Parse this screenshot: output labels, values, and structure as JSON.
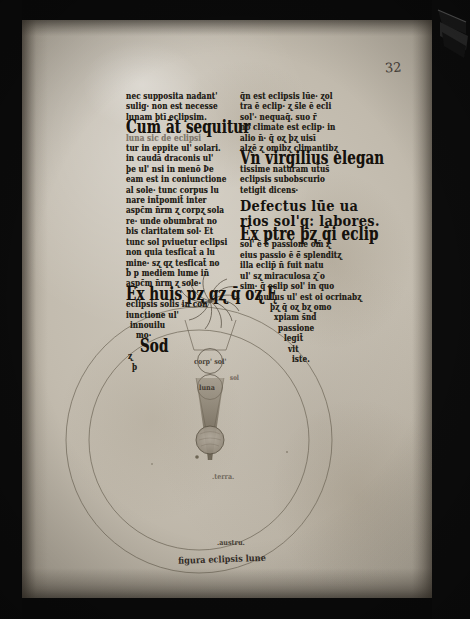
{
  "folio": {
    "number": "32"
  },
  "columns": {
    "left": {
      "lines": [
        {
          "t": "nec supposita nadant'",
          "s": "n"
        },
        {
          "t": "sulig· non est necesse",
          "s": "n"
        },
        {
          "t": "lunam þtī eclipsim.",
          "s": "n"
        },
        {
          "t": "Cum āt sequitur",
          "s": "i"
        },
        {
          "t": "luna sic de eclipsi",
          "s": "f"
        },
        {
          "t": "tur in eppite ul' solari.",
          "s": "n"
        },
        {
          "t": "in caudā draconis ul'",
          "s": "n"
        },
        {
          "t": "þe ul' nsi in menō Þe",
          "s": "n"
        },
        {
          "t": "eam est in coniunctione",
          "s": "n"
        },
        {
          "t": "al sole· tunc corpus lu",
          "s": "n"
        },
        {
          "t": "nare int̄pomit̄ inter",
          "s": "n"
        },
        {
          "t": "aspc̄m n̄rm ʐ corpʐ sola",
          "s": "n"
        },
        {
          "t": "re· unde obumbrat no",
          "s": "n"
        },
        {
          "t": "bis claritatem sol· Et",
          "s": "n"
        },
        {
          "t": "tunc sol pviuetur eclipsi",
          "s": "n"
        },
        {
          "t": "non quia tesficat̄ a lu",
          "s": "n"
        },
        {
          "t": "mine· sʐ qʐ tesficat̄ no",
          "s": "n"
        },
        {
          "t": "b̄ p mediem lume in̄",
          "s": "n"
        },
        {
          "t": "aspc̄m n̄rm ʐ sole·",
          "s": "n"
        },
        {
          "t": "Ex huis pʐ qʐ q̄ oʐ Ę",
          "s": "i"
        },
        {
          "t": "eclipsis solis in con",
          "s": "n"
        },
        {
          "t": "iunctione ul'",
          "s": "n"
        },
        {
          "t": "innouilu",
          "s": "n"
        },
        {
          "t": "mo·",
          "s": "n"
        },
        {
          "t": "Sod",
          "s": "i"
        },
        {
          "t": "ʐ",
          "s": "n"
        },
        {
          "t": "þ",
          "s": "n"
        }
      ],
      "marginal": "sol"
    },
    "right": {
      "lines": [
        {
          "t": "q̄n est eclipsis lūe· ʐol",
          "s": "n"
        },
        {
          "t": "tra ē eclip· ʐ s̄le ē ecli",
          "s": "n"
        },
        {
          "t": "sol'· nequaq̄. suo r̄",
          "s": "n"
        },
        {
          "t": "no climate est eclip· in",
          "s": "n"
        },
        {
          "t": "alio n̄· q̄ oʐ þʐ uisī",
          "s": "n"
        },
        {
          "t": "alʐē ʐ omibʐ climantibʐ",
          "s": "n"
        },
        {
          "t": "Vn virgilius elegan",
          "s": "i"
        },
        {
          "t": "tissime naturam ut̄us̄",
          "s": "n"
        },
        {
          "t": "eclipsis subobscurio",
          "s": "n"
        },
        {
          "t": "tetigit dicens·",
          "s": "n"
        }
      ],
      "heading": [
        "Defectus lūe ua",
        "rios sol'q: labores."
      ],
      "lines2": [
        {
          "t": "Ex ptre þʐ q̄i eclip",
          "s": "i"
        },
        {
          "t": "sol' ē ē̄ passione om̄ ʐ",
          "s": "n"
        },
        {
          "t": "eius passio ē ē̄ splenditʐ",
          "s": "n"
        },
        {
          "t": "illa eclip̄ n̄ fuit natu",
          "s": "n"
        },
        {
          "t": "ul' sʐ miraculosa ʐ ̄o",
          "s": "n"
        },
        {
          "t": "sim· q̄ eclip sol' in quo",
          "s": "n"
        },
        {
          "t": "nullus ul' est oi ocrinabʐ",
          "s": "n"
        },
        {
          "t": "þʐ q̄ oʐ bʐ omo",
          "s": "n"
        },
        {
          "t": "xpiam s̄nd̄",
          "s": "n"
        },
        {
          "t": "passione",
          "s": "n"
        },
        {
          "t": "legit̄",
          "s": "n"
        },
        {
          "t": "vit",
          "s": "n"
        },
        {
          "t": "iste.",
          "s": "n"
        }
      ]
    }
  },
  "diagram": {
    "labels": {
      "sun_body": "corp' sol'",
      "middle_circle": "luna",
      "earth": ".terra.",
      "south": ".austru.",
      "caption": "figura eclipsis lune"
    }
  },
  "colors": {
    "parchment": "#c6bfb2",
    "ink": "#241f18",
    "shadow_cone": "#7c7263",
    "frame_dark": "#0a0a0a"
  }
}
